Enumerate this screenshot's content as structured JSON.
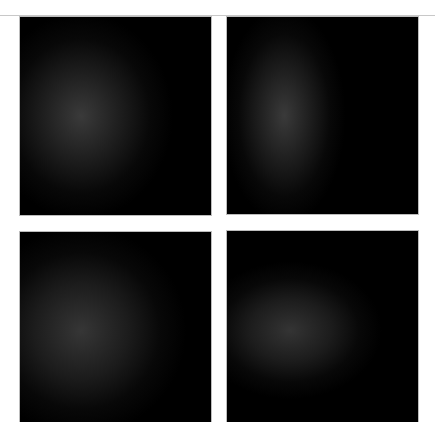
{
  "panels": [
    {
      "id": "top-left",
      "background": "#000000",
      "glow": {
        "cx": "32%",
        "cy": "50%",
        "rx": "48%",
        "ry": "52%",
        "color": "#3a3a3a"
      }
    },
    {
      "id": "top-right",
      "background": "#000000",
      "glow": {
        "cx": "30%",
        "cy": "50%",
        "rx": "32%",
        "ry": "55%",
        "color": "#3a3a3a"
      }
    },
    {
      "id": "bottom-left",
      "background": "#000000",
      "glow": {
        "cx": "32%",
        "cy": "52%",
        "rx": "55%",
        "ry": "55%",
        "color": "#363636"
      }
    },
    {
      "id": "bottom-right",
      "background": "#000000",
      "glow": {
        "cx": "33%",
        "cy": "52%",
        "rx": "48%",
        "ry": "36%",
        "color": "#343434"
      }
    }
  ],
  "colors": {
    "page_background": "#ffffff",
    "rule": "#c8c8c8"
  }
}
